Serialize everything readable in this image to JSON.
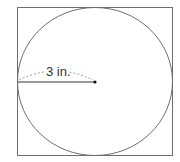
{
  "diagram": {
    "shapes": [
      "square",
      "inscribed-circle"
    ],
    "radius_label": "3 in.",
    "radius_value": 3,
    "unit": "in.",
    "stroke_color": "#6e6e6e",
    "line_color": "#333333",
    "dash_color": "#9a9a9a"
  }
}
